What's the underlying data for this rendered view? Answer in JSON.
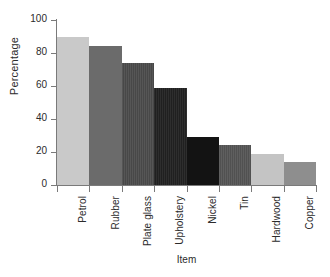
{
  "chart_data": {
    "type": "bar",
    "title": "",
    "xlabel": "Item",
    "ylabel": "Percentage",
    "categories": [
      "Petrol",
      "Rubber",
      "Plate glass",
      "Upholstery",
      "Nickel",
      "Tin",
      "Hardwood",
      "Copper"
    ],
    "values": [
      90,
      84,
      74,
      59,
      29,
      24,
      19,
      14
    ],
    "ylim": [
      0,
      100
    ],
    "yticks": [
      0,
      20,
      40,
      60,
      80,
      100
    ],
    "ytick_labels": [
      "0",
      "20",
      "40",
      "60",
      "80",
      "100"
    ],
    "grid": false,
    "legend": false,
    "bar_colors": [
      "#c9c9c9",
      "#6b6b6b",
      "#565656",
      "#2e2e2e",
      "#131313",
      "#5f5f5f",
      "#c4c4c4",
      "#8e8e8e"
    ],
    "bar_textures": [
      "solid",
      "solid",
      "striped",
      "striped",
      "solid",
      "striped",
      "solid",
      "solid"
    ],
    "axis_color": "#7a7a7a",
    "text_color": "#2b2b2b",
    "background": "#ffffff"
  }
}
